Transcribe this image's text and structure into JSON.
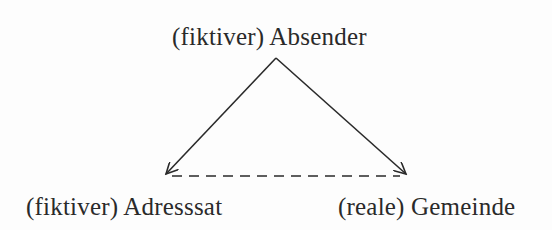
{
  "diagram": {
    "type": "triangle-communication-diagram",
    "nodes": {
      "top": {
        "label": "(fiktiver) Absender"
      },
      "left": {
        "label": "(fiktiver) Adresssat"
      },
      "right": {
        "label": "(reale) Gemeinde"
      }
    },
    "edges": [
      {
        "from": "top",
        "to": "left",
        "style": "solid",
        "arrow": "end"
      },
      {
        "from": "top",
        "to": "right",
        "style": "solid",
        "arrow": "end"
      },
      {
        "from": "left",
        "to": "right",
        "style": "dashed",
        "arrow": "none"
      }
    ],
    "colors": {
      "line": "#2a2a2a",
      "background": "#fdfdfd",
      "text": "#2a2a2a"
    }
  }
}
